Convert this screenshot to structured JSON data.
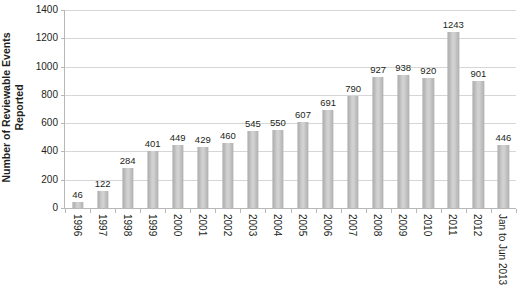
{
  "chart_data": {
    "type": "bar",
    "title": "",
    "subtitle": "",
    "xlabel": "",
    "ylabel": "Number of Reviewable Events Reported",
    "ylabel_lines": [
      "Number of Reviewable Events",
      "Reported"
    ],
    "categories": [
      "1996",
      "1997",
      "1998",
      "1999",
      "2000",
      "2001",
      "2002",
      "2003",
      "2004",
      "2005",
      "2006",
      "2007",
      "2008",
      "2009",
      "2010",
      "2011",
      "2012",
      "Jan to Jun 2013"
    ],
    "values": [
      46,
      122,
      284,
      401,
      449,
      429,
      460,
      545,
      550,
      607,
      691,
      790,
      927,
      938,
      920,
      1243,
      901,
      446
    ],
    "data_labels": [
      "46",
      "122",
      "284",
      "401",
      "449",
      "429",
      "460",
      "545",
      "550",
      "607",
      "691",
      "790",
      "927",
      "938",
      "920",
      "1243",
      "901",
      "446"
    ],
    "ylim": [
      0,
      1400
    ],
    "y_ticks": [
      0,
      200,
      400,
      600,
      800,
      1000,
      1200,
      1400
    ],
    "y_tick_labels": [
      "0",
      "200",
      "400",
      "600",
      "800",
      "1000",
      "1200",
      "1400"
    ],
    "grid": true,
    "grid_axis": "y",
    "legend": false,
    "legend_position": "none",
    "colors": {
      "bar_fill": "#cccccc",
      "bar_edge": "#b0b0b0",
      "gridline": "#d6d6d6",
      "axis_line": "#b8b8b8",
      "text": "#231f20",
      "background": "#ffffff"
    }
  }
}
